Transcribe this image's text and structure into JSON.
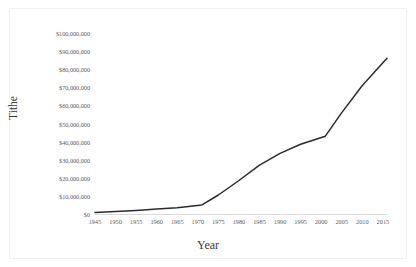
{
  "chart_data": {
    "type": "line",
    "title": "",
    "xlabel": "Year",
    "ylabel": "Tithe",
    "xlim": [
      1945,
      2016
    ],
    "ylim": [
      0,
      100000000
    ],
    "grid": false,
    "legend": false,
    "line_color": "#2b2b2b",
    "x_tick_labels": [
      "1945",
      "1950",
      "1955",
      "1960",
      "1965",
      "1970",
      "1975",
      "1980",
      "1985",
      "1990",
      "1995",
      "2000",
      "2005",
      "2010",
      "2015"
    ],
    "x_ticks": [
      1945,
      1950,
      1955,
      1960,
      1965,
      1970,
      1975,
      1980,
      1985,
      1990,
      1995,
      2000,
      2005,
      2010,
      2015
    ],
    "y_tick_labels": [
      "$100,000,000",
      "$90,000,000",
      "$80,000,000",
      "$70,000,000",
      "$60,000,000",
      "$50,000,000",
      "$40,000,000",
      "$30,000,000",
      "$20,000,000",
      "$10,000,000",
      "$0"
    ],
    "y_ticks": [
      100000000,
      90000000,
      80000000,
      70000000,
      60000000,
      50000000,
      40000000,
      30000000,
      20000000,
      10000000,
      0
    ],
    "series": [
      {
        "name": "Tithe",
        "x": [
          1945,
          1950,
          1955,
          1960,
          1965,
          1971,
          1975,
          1980,
          1985,
          1990,
          1995,
          2001,
          2005,
          2010,
          2016
        ],
        "values": [
          800000,
          1400000,
          2000000,
          2700000,
          3500000,
          5000000,
          10500000,
          18500000,
          27000000,
          33500000,
          38500000,
          43000000,
          56000000,
          71000000,
          86000000
        ]
      }
    ]
  },
  "axis_titles": {
    "x": "Year",
    "y": "Tithe"
  }
}
